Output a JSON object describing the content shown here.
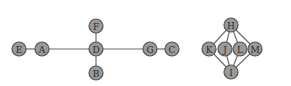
{
  "diagram": {
    "type": "graph",
    "node_radius": 7,
    "colors": {
      "node_fill": "#9a9a9a",
      "node_stroke": "#555555",
      "edge": "#6e6e6e",
      "background": "#ffffff"
    },
    "nodes": [
      {
        "id": "E",
        "x": 19,
        "y": 49
      },
      {
        "id": "A",
        "x": 42,
        "y": 49
      },
      {
        "id": "D",
        "x": 96,
        "y": 49
      },
      {
        "id": "F",
        "x": 96,
        "y": 26
      },
      {
        "id": "B",
        "x": 96,
        "y": 73
      },
      {
        "id": "G",
        "x": 150,
        "y": 49
      },
      {
        "id": "C",
        "x": 172,
        "y": 49
      },
      {
        "id": "H",
        "x": 231,
        "y": 25
      },
      {
        "id": "K",
        "x": 209,
        "y": 49
      },
      {
        "id": "J",
        "x": 225,
        "y": 49
      },
      {
        "id": "L",
        "x": 240,
        "y": 49
      },
      {
        "id": "M",
        "x": 255,
        "y": 49
      },
      {
        "id": "I",
        "x": 231,
        "y": 72
      }
    ],
    "edges": [
      [
        "E",
        "A"
      ],
      [
        "A",
        "D"
      ],
      [
        "D",
        "F"
      ],
      [
        "D",
        "B"
      ],
      [
        "D",
        "G"
      ],
      [
        "G",
        "C"
      ],
      [
        "H",
        "K"
      ],
      [
        "H",
        "J"
      ],
      [
        "H",
        "L"
      ],
      [
        "H",
        "M"
      ],
      [
        "I",
        "K"
      ],
      [
        "I",
        "J"
      ],
      [
        "I",
        "L"
      ],
      [
        "I",
        "M"
      ]
    ]
  }
}
